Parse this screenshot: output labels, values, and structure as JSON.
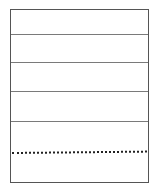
{
  "sheet": {
    "border_color": "#555555",
    "rule_color": "#7a7a7a",
    "dotted_color": "#222222",
    "solid_rules": [
      {
        "y": 24
      },
      {
        "y": 52
      },
      {
        "y": 81
      },
      {
        "y": 111
      }
    ],
    "dotted_rule": {
      "y": 142
    }
  }
}
